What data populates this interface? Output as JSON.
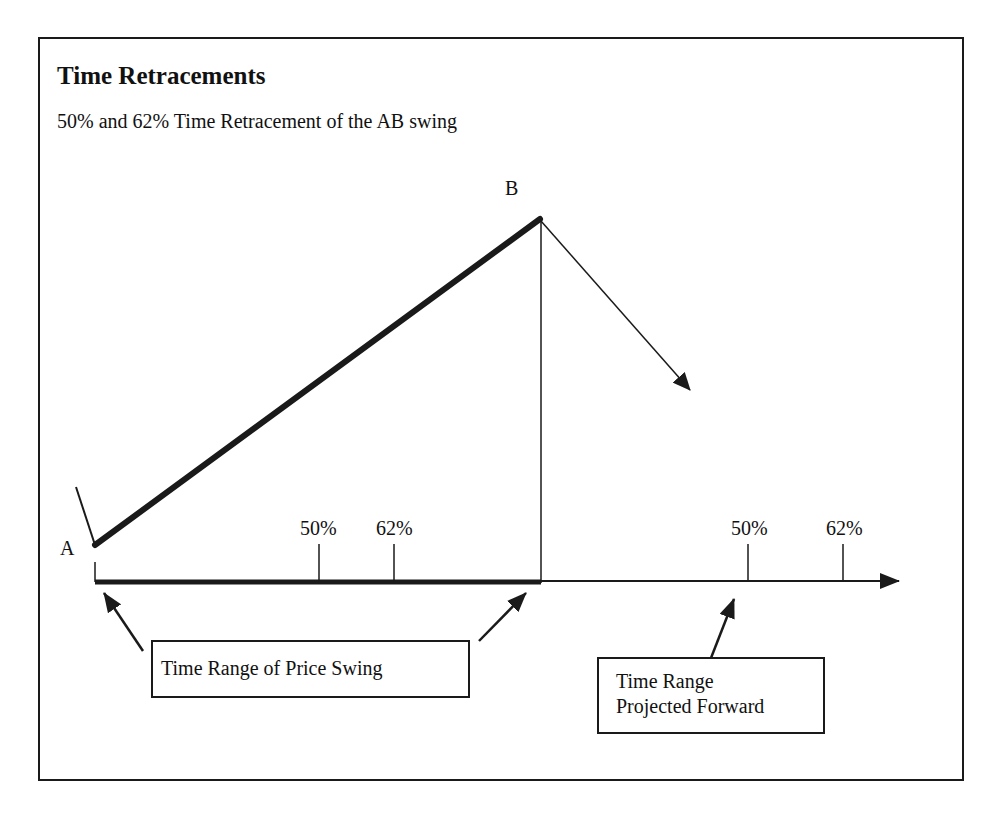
{
  "header": {
    "title": "Time Retracements",
    "subtitle": "50% and 62% Time Retracement of the AB swing"
  },
  "points": {
    "a_label": "A",
    "b_label": "B"
  },
  "swing_ticks": [
    {
      "label": "50%",
      "x": 319
    },
    {
      "label": "62%",
      "x": 394
    }
  ],
  "projected_ticks": [
    {
      "label": "50%",
      "x": 748
    },
    {
      "label": "62%",
      "x": 843
    }
  ],
  "callouts": {
    "price_swing_box": "Time Range of Price Swing",
    "projected_box_line1": "Time Range",
    "projected_box_line2": "Projected Forward"
  },
  "colors": {
    "line": "#1a1a1a",
    "background": "#ffffff"
  }
}
